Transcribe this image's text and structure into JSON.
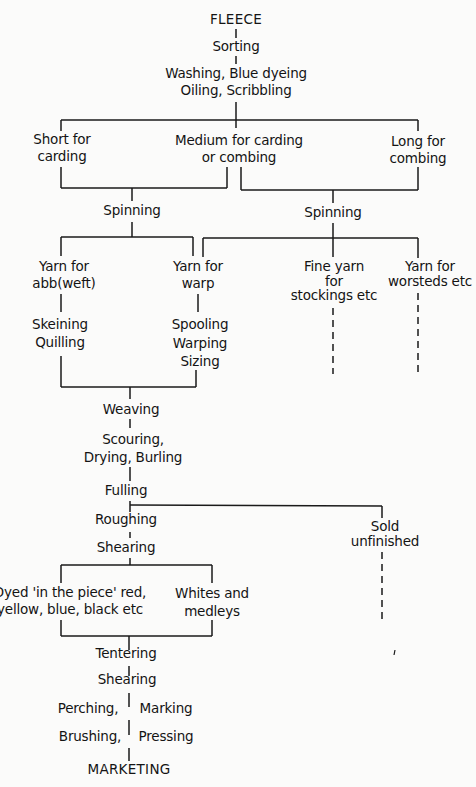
{
  "diagram": {
    "nodes": {
      "fleece": {
        "lines": [
          "FLEECE"
        ]
      },
      "sorting": {
        "lines": [
          "Sorting"
        ]
      },
      "washing": {
        "lines": [
          "Washing, Blue dyeing",
          "Oiling, Scribbling"
        ]
      },
      "short": {
        "lines": [
          "Short for",
          "carding"
        ]
      },
      "medium": {
        "lines": [
          "Medium for carding",
          "or combing"
        ]
      },
      "long": {
        "lines": [
          "Long for",
          "combing"
        ]
      },
      "spinning_left": {
        "lines": [
          "Spinning"
        ]
      },
      "spinning_right": {
        "lines": [
          "Spinning"
        ]
      },
      "yarn_weft": {
        "lines": [
          "Yarn for",
          "abb(weft)"
        ]
      },
      "yarn_warp": {
        "lines": [
          "Yarn for",
          "warp"
        ]
      },
      "fine_yarn": {
        "lines": [
          "Fine yarn",
          "for",
          "stockings etc"
        ]
      },
      "yarn_worsteds": {
        "lines": [
          "Yarn for",
          "worsteds etc"
        ]
      },
      "skeining": {
        "lines": [
          "Skeining",
          "Quilling"
        ]
      },
      "spooling": {
        "lines": [
          "Spooling",
          "Warping",
          "Sizing"
        ]
      },
      "weaving": {
        "lines": [
          "Weaving"
        ]
      },
      "scouring": {
        "lines": [
          "Scouring,",
          "Drying, Burling"
        ]
      },
      "fulling": {
        "lines": [
          "Fulling"
        ]
      },
      "roughing": {
        "lines": [
          "Roughing"
        ]
      },
      "sold_unfinished": {
        "lines": [
          "Sold",
          "unfinished"
        ]
      },
      "shearing_1": {
        "lines": [
          "Shearing"
        ]
      },
      "dyed": {
        "lines": [
          "Dyed 'in the piece' red,",
          "yellow, blue, black etc"
        ]
      },
      "whites": {
        "lines": [
          "Whites and",
          "medleys"
        ]
      },
      "tentering": {
        "lines": [
          "Tentering"
        ]
      },
      "shearing_2": {
        "lines": [
          "Shearing"
        ]
      },
      "perching": {
        "lines": [
          "Perching,",
          "Marking"
        ]
      },
      "brushing": {
        "lines": [
          "Brushing,",
          "Pressing"
        ]
      },
      "marketing": {
        "lines": [
          "MARKETING"
        ]
      }
    },
    "edges": [
      [
        "FLEECE",
        "Sorting"
      ],
      [
        "Sorting",
        "Washing, Blue dyeing / Oiling, Scribbling"
      ],
      [
        "Washing, Blue dyeing / Oiling, Scribbling",
        "Short for carding"
      ],
      [
        "Washing, Blue dyeing / Oiling, Scribbling",
        "Medium for carding or combing"
      ],
      [
        "Washing, Blue dyeing / Oiling, Scribbling",
        "Long for combing"
      ],
      [
        "Short for carding",
        "Spinning (left)"
      ],
      [
        "Medium for carding or combing",
        "Spinning (left)"
      ],
      [
        "Medium for carding or combing",
        "Spinning (right)"
      ],
      [
        "Long for combing",
        "Spinning (right)"
      ],
      [
        "Spinning (left)",
        "Yarn for abb(weft)"
      ],
      [
        "Spinning (left)",
        "Yarn for warp"
      ],
      [
        "Spinning (right)",
        "Yarn for warp"
      ],
      [
        "Spinning (right)",
        "Fine yarn for stockings etc"
      ],
      [
        "Spinning (right)",
        "Yarn for worsteds etc"
      ],
      [
        "Yarn for abb(weft)",
        "Skeining, Quilling"
      ],
      [
        "Yarn for warp",
        "Spooling, Warping, Sizing"
      ],
      [
        "Skeining, Quilling",
        "Weaving"
      ],
      [
        "Spooling, Warping, Sizing",
        "Weaving"
      ],
      [
        "Weaving",
        "Scouring, Drying, Burling"
      ],
      [
        "Scouring, Drying, Burling",
        "Fulling"
      ],
      [
        "Fulling",
        "Roughing"
      ],
      [
        "Fulling",
        "Sold unfinished"
      ],
      [
        "Roughing",
        "Shearing"
      ],
      [
        "Shearing",
        "Dyed 'in the piece'"
      ],
      [
        "Shearing",
        "Whites and medleys"
      ],
      [
        "Dyed 'in the piece'",
        "Tentering"
      ],
      [
        "Whites and medleys",
        "Tentering"
      ],
      [
        "Tentering",
        "Shearing"
      ],
      [
        "Shearing",
        "Perching, Marking"
      ],
      [
        "Perching, Marking",
        "Brushing, Pressing"
      ],
      [
        "Brushing, Pressing",
        "MARKETING"
      ]
    ],
    "dashed_continuations": [
      "Fine yarn for stockings etc",
      "Yarn for worsteds etc",
      "Sold unfinished"
    ],
    "colors": {
      "background": "#fbfbfa",
      "ink": "#1a1a1a"
    }
  }
}
